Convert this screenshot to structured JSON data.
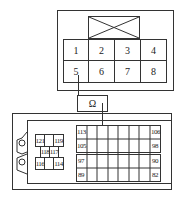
{
  "top_connector": {
    "pins_row1": [
      "1",
      "2",
      "3",
      "4"
    ],
    "pins_row2": [
      "5",
      "6",
      "7",
      "8"
    ]
  },
  "meter": {
    "symbol": "Ω"
  },
  "bottom_connector": {
    "left_block": {
      "top": [
        "121",
        "",
        "119"
      ],
      "middle": [
        "118",
        "117"
      ],
      "bottom": [
        "116",
        "",
        "114"
      ]
    },
    "right_block": {
      "row1": {
        "left": "113",
        "right": "106"
      },
      "row2": {
        "left": "105",
        "right": "98"
      },
      "row3": {
        "left": "97",
        "right": "90"
      },
      "row4": {
        "left": "89",
        "right": "82"
      }
    }
  }
}
